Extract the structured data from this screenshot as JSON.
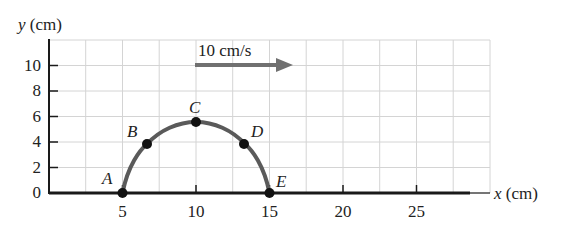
{
  "chart_data": {
    "type": "line",
    "title": "",
    "xlabel": "x (cm)",
    "ylabel": "y (cm)",
    "x_ticks": [
      5,
      10,
      15,
      20,
      25
    ],
    "x_tick_labels": [
      "5",
      "10",
      "15",
      "20",
      "25"
    ],
    "y_ticks": [
      0,
      2,
      4,
      6,
      8,
      10
    ],
    "y_tick_labels": [
      "0",
      "2",
      "4",
      "6",
      "8",
      "10"
    ],
    "xlim": [
      0,
      30
    ],
    "ylim": [
      0,
      12
    ],
    "grid": true,
    "grid_spacing": {
      "x": 2.5,
      "y": 2
    },
    "series": [
      {
        "name": "trajectory",
        "color": "#555555",
        "description": "arc from A to E on top of the x-axis",
        "points": [
          {
            "label": "A",
            "x": 5,
            "y": 0
          },
          {
            "label": "B",
            "x": 6.7,
            "y": 4
          },
          {
            "label": "C",
            "x": 10,
            "y": 5.6
          },
          {
            "label": "D",
            "x": 13.3,
            "y": 4
          },
          {
            "label": "E",
            "x": 15,
            "y": 0
          }
        ]
      }
    ],
    "annotations": [
      {
        "type": "arrow",
        "text": "10 cm/s",
        "from": {
          "x": 10,
          "y": 10
        },
        "to": {
          "x": 16.5,
          "y": 10
        },
        "color": "#707070"
      }
    ],
    "legend": null
  },
  "labels": {
    "y_axis": "y (cm)",
    "x_axis": "x (cm)",
    "velocity": "10 cm/s",
    "point_a": "A",
    "point_b": "B",
    "point_c": "C",
    "point_d": "D",
    "point_e": "E",
    "xtick_5": "5",
    "xtick_10": "10",
    "xtick_15": "15",
    "xtick_20": "20",
    "xtick_25": "25",
    "ytick_0": "0",
    "ytick_2": "2",
    "ytick_4": "4",
    "ytick_6": "6",
    "ytick_8": "8",
    "ytick_10": "10"
  },
  "colors": {
    "grid": "#d0d0d0",
    "axis": "#1a1a1a",
    "curve": "#555555",
    "arrow": "#707070",
    "point": "#111111"
  }
}
